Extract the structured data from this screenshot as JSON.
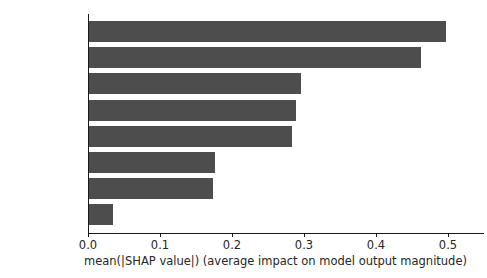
{
  "chart_data": {
    "type": "bar",
    "orientation": "horizontal",
    "title": "",
    "xlabel": "mean(|SHAP value|) (average impact on model output magnitude)",
    "ylabel": "",
    "categories": [
      "migration",
      "race",
      "age",
      "degree",
      "medical",
      "religions",
      "gender",
      "disabilities"
    ],
    "values": [
      0.497,
      0.463,
      0.296,
      0.289,
      0.284,
      0.177,
      0.173,
      0.035
    ],
    "xlim": [
      0.0,
      0.55
    ],
    "xticks": [
      0.0,
      0.1,
      0.2,
      0.3,
      0.4,
      0.5
    ],
    "xtick_labels": [
      "0.0",
      "0.1",
      "0.2",
      "0.3",
      "0.4",
      "0.5"
    ],
    "grid": false,
    "legend": null,
    "bar_color": "#4d4d4d",
    "axis_color": "#1a1a1a",
    "background": "#ffffff"
  }
}
